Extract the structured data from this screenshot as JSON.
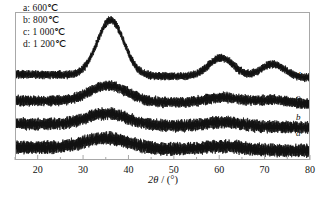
{
  "figure": {
    "background_color": "#ffffff",
    "frame_color": "#a8a8a8",
    "trace_color": "#111111"
  },
  "legend": {
    "entries": [
      {
        "key": "a",
        "label": "a: 600℃"
      },
      {
        "key": "b",
        "label": "b: 800℃"
      },
      {
        "key": "c",
        "label": "c: 1 000℃"
      },
      {
        "key": "d",
        "label": "d: 1 200℃"
      }
    ]
  },
  "curve_tags": {
    "d": "d",
    "c": "c",
    "b": "b",
    "a": "a"
  },
  "axis": {
    "x_title_symbol": "2θ",
    "x_title_unit": " / (°)",
    "x_title_full": "2θ / (°)",
    "tick_labels": [
      "20",
      "30",
      "40",
      "50",
      "60",
      "70",
      "80"
    ]
  },
  "chart_data": {
    "type": "line",
    "title": "",
    "subtitle": "",
    "xlabel": "2θ / (°)",
    "ylabel": "",
    "xlim": [
      15,
      80
    ],
    "ylim": [
      0,
      100
    ],
    "grid": false,
    "legend_position": "top-left",
    "x_ticks": [
      20,
      30,
      40,
      50,
      60,
      70,
      80
    ],
    "x_minor_tick_interval": 5,
    "y_axis_visible": false,
    "series": [
      {
        "name": "a: 600℃",
        "key": "a",
        "tag": "a",
        "offset": 8,
        "noise": 3.2,
        "peaks": [
          {
            "center": 35.0,
            "height": 7,
            "width": 7.0
          },
          {
            "center": 61.0,
            "height": 2.5,
            "width": 6.0
          }
        ],
        "x": [
          15,
          20,
          25,
          30,
          35,
          40,
          45,
          50,
          55,
          60,
          65,
          70,
          75,
          80
        ],
        "y": [
          12,
          11,
          11,
          13,
          16,
          13,
          11,
          10,
          10,
          11,
          10,
          9,
          8,
          7
        ]
      },
      {
        "name": "b: 800℃",
        "key": "b",
        "tag": "b",
        "offset": 24,
        "noise": 3.0,
        "peaks": [
          {
            "center": 35.2,
            "height": 8,
            "width": 6.5
          },
          {
            "center": 61.0,
            "height": 3,
            "width": 6.0
          }
        ],
        "x": [
          15,
          20,
          25,
          30,
          35,
          40,
          45,
          50,
          55,
          60,
          65,
          70,
          75,
          80
        ],
        "y": [
          27,
          26,
          26,
          28,
          32,
          28,
          26,
          25,
          25,
          27,
          26,
          25,
          24,
          23
        ]
      },
      {
        "name": "c: 1 000℃",
        "key": "c",
        "tag": "c",
        "offset": 40,
        "noise": 2.6,
        "peaks": [
          {
            "center": 35.5,
            "height": 11,
            "width": 6.0
          },
          {
            "center": 61.0,
            "height": 4,
            "width": 5.5
          },
          {
            "center": 72.0,
            "height": 2.5,
            "width": 5.0
          }
        ],
        "x": [
          15,
          20,
          25,
          30,
          35,
          40,
          45,
          50,
          55,
          60,
          65,
          70,
          75,
          80
        ],
        "y": [
          43,
          42,
          42,
          45,
          51,
          45,
          42,
          41,
          41,
          44,
          43,
          42,
          41,
          39
        ]
      },
      {
        "name": "d: 1 200℃",
        "key": "d",
        "tag": "d",
        "offset": 58,
        "noise": 2.0,
        "peaks": [
          {
            "center": 36.0,
            "height": 38,
            "width": 4.2
          },
          {
            "center": 60.5,
            "height": 13,
            "width": 4.0
          },
          {
            "center": 72.0,
            "height": 9,
            "width": 3.8
          }
        ],
        "x": [
          15,
          20,
          25,
          30,
          35,
          40,
          45,
          50,
          55,
          60,
          65,
          70,
          75,
          80
        ],
        "y": [
          60,
          59,
          59,
          63,
          95,
          70,
          61,
          59,
          60,
          71,
          62,
          66,
          61,
          57
        ]
      }
    ]
  }
}
